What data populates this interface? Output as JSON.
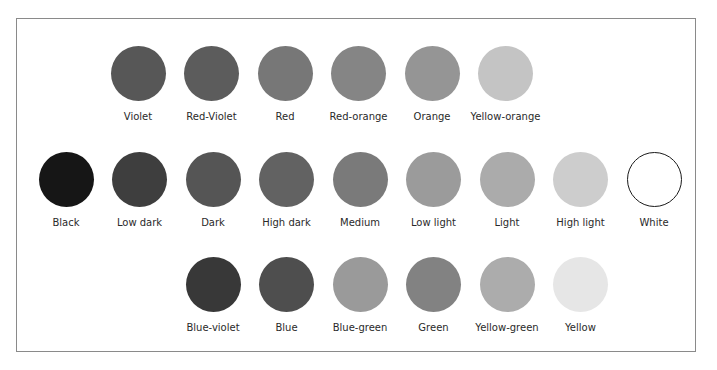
{
  "rows": [
    {
      "name": "warm-hues",
      "items": [
        {
          "label": "Violet",
          "color": "#575757"
        },
        {
          "label": "Red-Violet",
          "color": "#5c5c5c"
        },
        {
          "label": "Red",
          "color": "#777777"
        },
        {
          "label": "Red-orange",
          "color": "#858585"
        },
        {
          "label": "Orange",
          "color": "#959595"
        },
        {
          "label": "Yellow-orange",
          "color": "#c4c4c4"
        }
      ]
    },
    {
      "name": "value-scale",
      "items": [
        {
          "label": "Black",
          "color": "#161616"
        },
        {
          "label": "Low dark",
          "color": "#3e3e3e"
        },
        {
          "label": "Dark",
          "color": "#555555"
        },
        {
          "label": "High dark",
          "color": "#626262"
        },
        {
          "label": "Medium",
          "color": "#7a7a7a"
        },
        {
          "label": "Low light",
          "color": "#9b9b9b"
        },
        {
          "label": "Light",
          "color": "#ababab"
        },
        {
          "label": "High light",
          "color": "#cdcdcd"
        },
        {
          "label": "White",
          "color": "#ffffff",
          "outlined": true
        }
      ]
    },
    {
      "name": "cool-hues",
      "items": [
        {
          "label": "Blue-violet",
          "color": "#383838"
        },
        {
          "label": "Blue",
          "color": "#4e4e4e"
        },
        {
          "label": "Blue-green",
          "color": "#9a9a9a"
        },
        {
          "label": "Green",
          "color": "#828282"
        },
        {
          "label": "Yellow-green",
          "color": "#acacac"
        },
        {
          "label": "Yellow",
          "color": "#e6e6e6"
        }
      ]
    }
  ]
}
